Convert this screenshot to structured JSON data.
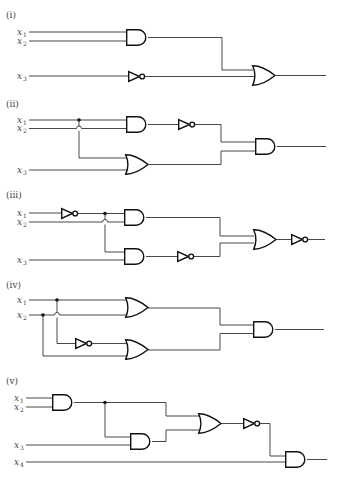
{
  "figure": {
    "circuits": [
      {
        "label": "(i)",
        "inputs": [
          {
            "var": "x",
            "sub": "1"
          },
          {
            "var": "x",
            "sub": "2"
          },
          {
            "var": "x",
            "sub": "3"
          }
        ],
        "gates": [
          "AND(x1,x2)",
          "NOT(x3)",
          "OR"
        ]
      },
      {
        "label": "(ii)",
        "inputs": [
          {
            "var": "x",
            "sub": "1"
          },
          {
            "var": "x",
            "sub": "2"
          },
          {
            "var": "x",
            "sub": "3"
          }
        ],
        "gates": [
          "AND(x1,x2)",
          "NOT",
          "OR(x1,x3)",
          "AND"
        ]
      },
      {
        "label": "(iii)",
        "inputs": [
          {
            "var": "x",
            "sub": "1"
          },
          {
            "var": "x",
            "sub": "2"
          },
          {
            "var": "x",
            "sub": "3"
          }
        ],
        "gates": [
          "NOT(x1)",
          "AND(x1',x2)",
          "AND(x1',x3)",
          "NOT",
          "OR",
          "NOT"
        ]
      },
      {
        "label": "(iv)",
        "inputs": [
          {
            "var": "x",
            "sub": "1"
          },
          {
            "var": "x",
            "sub": "2"
          }
        ],
        "gates": [
          "OR(x1,x2)",
          "NOT(x1)",
          "OR(x1',x2)",
          "AND"
        ]
      },
      {
        "label": "(v)",
        "inputs": [
          {
            "var": "x",
            "sub": "1"
          },
          {
            "var": "x",
            "sub": "2"
          },
          {
            "var": "x",
            "sub": "3"
          },
          {
            "var": "x",
            "sub": "4"
          }
        ],
        "gates": [
          "AND(x1,x2)",
          "AND(.,x3)",
          "OR",
          "NOT",
          "AND(.,x4)"
        ]
      }
    ]
  }
}
